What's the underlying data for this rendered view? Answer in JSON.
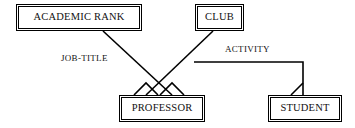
{
  "diagram": {
    "type": "entity-relationship-diagram",
    "canvas": {
      "width": 355,
      "height": 128,
      "background": "#ffffff"
    },
    "line_color": "#000000",
    "text_color": "#111111",
    "entities": [
      {
        "id": "academic-rank",
        "label": "ACADEMIC RANK",
        "x": 16,
        "y": 4,
        "width": 126,
        "height": 27
      },
      {
        "id": "club",
        "label": "CLUB",
        "x": 195,
        "y": 4,
        "width": 49,
        "height": 27
      },
      {
        "id": "professor",
        "label": "PROFESSOR",
        "x": 119,
        "y": 95,
        "width": 86,
        "height": 27
      },
      {
        "id": "student",
        "label": "STUDENT",
        "x": 268,
        "y": 95,
        "width": 74,
        "height": 27
      }
    ],
    "relationships": [
      {
        "id": "job-title",
        "label": "JOB-TITLE",
        "from": "academic-rank",
        "to": "professor",
        "label_x": 60,
        "label_y": 54
      },
      {
        "id": "activity",
        "label": "ACTIVITY",
        "from": "club",
        "to": "student",
        "label_x": 224,
        "label_y": 45
      }
    ],
    "crow_feet": [
      {
        "id": "professor-job-title-foot",
        "at_entity": "professor"
      },
      {
        "id": "professor-activity-foot",
        "at_entity": "professor"
      },
      {
        "id": "student-activity-foot",
        "at_entity": "student"
      }
    ]
  }
}
